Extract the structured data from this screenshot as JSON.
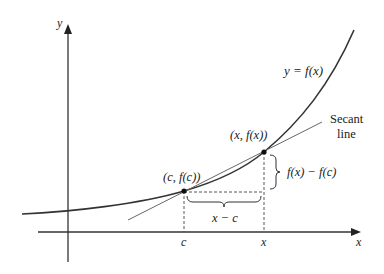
{
  "diagram": {
    "axes": {
      "x_label": "x",
      "y_label": "y"
    },
    "curve_label": "y = f(x)",
    "secant_label_line1": "Secant",
    "secant_label_line2": "line",
    "points": [
      {
        "label": "(c, f(c))",
        "name": "point-c"
      },
      {
        "label": "(x, f(x))",
        "name": "point-x"
      }
    ],
    "tick_labels": {
      "c": "c",
      "x": "x"
    },
    "brace_labels": {
      "horizontal": "x − c",
      "vertical": "f(x) − f(c)"
    },
    "colors": {
      "curve": "#333333",
      "secant": "#666666",
      "axes": "#333333",
      "dashed": "#444444"
    }
  }
}
